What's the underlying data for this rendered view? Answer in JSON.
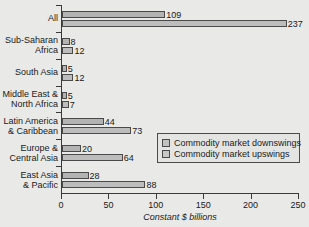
{
  "chart_data": {
    "type": "bar",
    "orientation": "horizontal",
    "title": "",
    "subtitle": "",
    "xlabel": "Constant $ billions",
    "ylabel": "",
    "xlim": [
      0,
      250
    ],
    "xticks": [
      0,
      50,
      100,
      150,
      200,
      250
    ],
    "xtick_labels": [
      "0",
      "50",
      "100",
      "150",
      "200",
      "250"
    ],
    "grid": false,
    "legend_position": "inside-lower-right",
    "categories": [
      "All",
      "Sub-Saharan\nAfrica",
      "South Asia",
      "Middle East &\nNorth Africa",
      "Latin America\n& Caribbean",
      "Europe &\nCentral Asia",
      "East Asia\n& Pacific"
    ],
    "series": [
      {
        "name": "Commodity market downswings",
        "color": "#b3b3b3",
        "values": [
          109,
          8,
          5,
          5,
          44,
          20,
          28
        ],
        "value_labels": [
          "109",
          "8",
          "5",
          "5",
          "44",
          "20",
          "28"
        ]
      },
      {
        "name": "Commodity market upswings",
        "color": "#bdbdbd",
        "values": [
          237,
          12,
          12,
          7,
          73,
          64,
          88
        ],
        "value_labels": [
          "237",
          "12",
          "12",
          "7",
          "73",
          "64",
          "88"
        ]
      }
    ]
  },
  "legend": {
    "items": [
      {
        "label": "Commodity market downswings",
        "color": "#b3b3b3"
      },
      {
        "label": "Commodity market upswings",
        "color": "#bdbdbd"
      }
    ]
  },
  "colors": {
    "background": "#e9e9e7",
    "axis": "#3a3a3a",
    "text": "#1a1a1a",
    "bar_border": "#4a4a4a"
  }
}
